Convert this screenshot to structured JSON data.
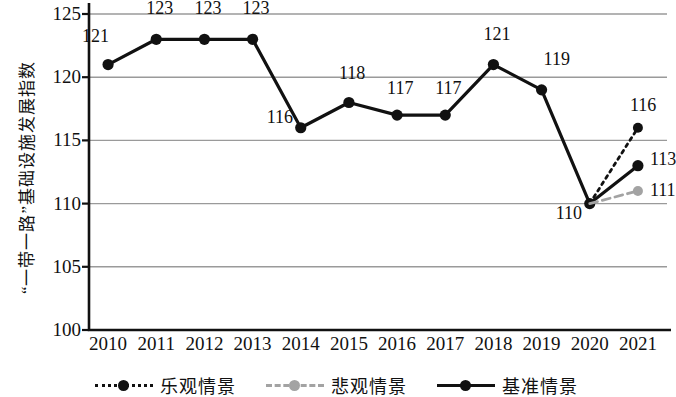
{
  "chart_data": {
    "type": "line",
    "title": "",
    "xlabel": "",
    "ylabel": "“一带一路”基础设施发展指数",
    "categories": [
      "2010",
      "2011",
      "2012",
      "2013",
      "2014",
      "2015",
      "2016",
      "2017",
      "2018",
      "2019",
      "2020",
      "2021"
    ],
    "ylim": [
      100,
      125
    ],
    "yticks": [
      100,
      105,
      110,
      115,
      120,
      125
    ],
    "grid": true,
    "legend_position": "bottom",
    "series": [
      {
        "name": "基准情景",
        "style": "solid",
        "color": "#111111",
        "values": [
          121,
          123,
          123,
          123,
          116,
          118,
          117,
          117,
          121,
          119,
          110,
          113
        ],
        "point_labels": [
          "121",
          "123",
          "123",
          "123",
          "116",
          "118",
          "117",
          "117",
          "121",
          "119",
          "110",
          "113"
        ]
      },
      {
        "name": "乐观情景",
        "style": "dotted",
        "color": "#111111",
        "values": [
          null,
          null,
          null,
          null,
          null,
          null,
          null,
          null,
          null,
          null,
          110,
          116
        ],
        "point_labels": [
          "",
          "",
          "",
          "",
          "",
          "",
          "",
          "",
          "",
          "",
          "",
          "116"
        ]
      },
      {
        "name": "悲观情景",
        "style": "dashed",
        "color": "#a3a3a3",
        "values": [
          null,
          null,
          null,
          null,
          null,
          null,
          null,
          null,
          null,
          null,
          110,
          111
        ],
        "point_labels": [
          "",
          "",
          "",
          "",
          "",
          "",
          "",
          "",
          "",
          "",
          "",
          "111"
        ]
      }
    ]
  },
  "axis": {
    "y_title": "“一带一路”基础设施发展指数",
    "y_ticks": [
      "125",
      "120",
      "115",
      "110",
      "105",
      "100"
    ],
    "x_ticks": [
      "2010",
      "2011",
      "2012",
      "2013",
      "2014",
      "2015",
      "2016",
      "2017",
      "2018",
      "2019",
      "2020",
      "2021"
    ]
  },
  "data_labels": {
    "baseline": [
      "121",
      "123",
      "123",
      "123",
      "116",
      "118",
      "117",
      "117",
      "121",
      "119",
      "110",
      "113"
    ],
    "optimistic_2021": "116",
    "pessimistic_2021": "111"
  },
  "legend": {
    "items": [
      {
        "label": "乐观情景",
        "style": "dotted",
        "color": "#111111"
      },
      {
        "label": "悲观情景",
        "style": "dashed",
        "color": "#a3a3a3"
      },
      {
        "label": "基准情景",
        "style": "solid",
        "color": "#111111"
      }
    ]
  },
  "colors": {
    "baseline": "#111111",
    "optimistic": "#111111",
    "pessimistic": "#a3a3a3",
    "grid": "#9a9a9a",
    "axis": "#111111",
    "background": "#ffffff"
  }
}
